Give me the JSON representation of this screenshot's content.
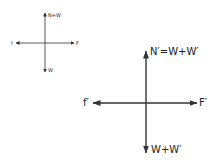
{
  "diagrams": [
    {
      "id": "small",
      "labels": {
        "up": "N=W",
        "down": "W",
        "left": "f",
        "right": "F"
      }
    },
    {
      "id": "large",
      "labels": {
        "up": "N′=W+W′",
        "down": "W+W′",
        "left": "f′",
        "right": "F′"
      }
    }
  ],
  "colors": {
    "line": "#333333",
    "text": "#222222",
    "background": "#ffffff"
  }
}
